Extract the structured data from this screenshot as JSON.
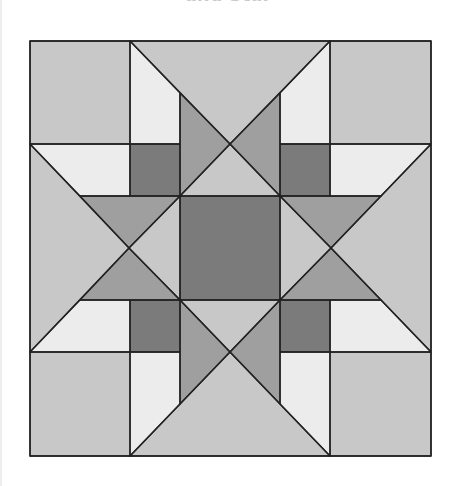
{
  "title": "and Star",
  "quilt": {
    "name": "star quilt block",
    "colors": {
      "light": "#c8c8c8",
      "white": "#ececec",
      "medium": "#9f9f9f",
      "dark": "#7b7b7b",
      "seam": "#222222"
    },
    "grid_x": [
      30,
      130,
      180,
      280,
      330,
      431
    ],
    "grid_y": [
      41,
      144,
      196,
      300,
      352,
      456
    ],
    "pieces": [
      {
        "name": "corner-top-left",
        "color": "light",
        "points": "30,41 130,41 130,144 30,144"
      },
      {
        "name": "corner-top-right",
        "color": "light",
        "points": "330,41 431,41 431,144 330,144"
      },
      {
        "name": "corner-bottom-left",
        "color": "light",
        "points": "30,352 130,352 130,456 30,456"
      },
      {
        "name": "corner-bottom-right",
        "color": "light",
        "points": "330,352 431,352 431,456 330,456"
      },
      {
        "name": "top-big-triangle",
        "color": "light",
        "points": "130,41 330,41 230,144"
      },
      {
        "name": "top-white-left",
        "color": "white",
        "points": "130,41 180,93 180,144 130,144"
      },
      {
        "name": "top-white-right",
        "color": "white",
        "points": "330,41 280,93 280,144 330,144"
      },
      {
        "name": "top-point-left",
        "color": "medium",
        "points": "180,93 230,144 180,196"
      },
      {
        "name": "top-point-right",
        "color": "medium",
        "points": "280,93 230,144 280,196"
      },
      {
        "name": "top-small-triangle",
        "color": "light",
        "points": "230,144 180,196 280,196"
      },
      {
        "name": "bottom-big-triangle",
        "color": "light",
        "points": "130,456 330,456 230,352"
      },
      {
        "name": "bottom-white-left",
        "color": "white",
        "points": "130,456 180,404 180,352 130,352"
      },
      {
        "name": "bottom-white-right",
        "color": "white",
        "points": "330,456 280,404 280,352 330,352"
      },
      {
        "name": "bottom-point-left",
        "color": "medium",
        "points": "180,404 230,352 180,300"
      },
      {
        "name": "bottom-point-right",
        "color": "medium",
        "points": "280,404 230,352 280,300"
      },
      {
        "name": "bottom-small-triangle",
        "color": "light",
        "points": "230,352 180,300 280,300"
      },
      {
        "name": "left-big-triangle",
        "color": "light",
        "points": "30,144 30,352 129,248"
      },
      {
        "name": "left-white-top",
        "color": "white",
        "points": "30,144 130,144 130,196 80,196"
      },
      {
        "name": "left-white-bottom",
        "color": "white",
        "points": "30,352 130,352 130,300 80,300"
      },
      {
        "name": "left-point-top",
        "color": "medium",
        "points": "80,196 180,196 129,248"
      },
      {
        "name": "left-point-bottom",
        "color": "medium",
        "points": "80,300 180,300 129,248"
      },
      {
        "name": "left-small-triangle",
        "color": "light",
        "points": "129,248 180,196 180,300"
      },
      {
        "name": "right-big-triangle",
        "color": "light",
        "points": "431,144 431,352 331,248"
      },
      {
        "name": "right-white-top",
        "color": "white",
        "points": "431,144 330,144 330,196 381,196"
      },
      {
        "name": "right-white-bottom",
        "color": "white",
        "points": "431,352 330,352 330,300 381,300"
      },
      {
        "name": "right-point-top",
        "color": "medium",
        "points": "381,196 280,196 331,248"
      },
      {
        "name": "right-point-bottom",
        "color": "medium",
        "points": "381,300 280,300 331,248"
      },
      {
        "name": "right-small-triangle",
        "color": "light",
        "points": "331,248 280,196 280,300"
      },
      {
        "name": "dark-square-top-left",
        "color": "dark",
        "points": "130,144 180,144 180,196 130,196"
      },
      {
        "name": "dark-square-top-right",
        "color": "dark",
        "points": "280,144 330,144 330,196 280,196"
      },
      {
        "name": "dark-square-bottom-left",
        "color": "dark",
        "points": "130,300 180,300 180,352 130,352"
      },
      {
        "name": "dark-square-bottom-right",
        "color": "dark",
        "points": "280,300 330,300 330,352 280,352"
      },
      {
        "name": "center-square",
        "color": "dark",
        "points": "180,196 280,196 280,300 180,300"
      }
    ]
  }
}
